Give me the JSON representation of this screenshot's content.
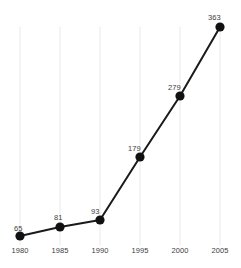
{
  "chart_data": {
    "type": "line",
    "title": "",
    "subtitle": "",
    "xlabel": "",
    "ylabel": "",
    "categories": [
      "1980",
      "1985",
      "1990",
      "1995",
      "2000",
      "2005"
    ],
    "values": [
      65,
      81,
      93,
      179,
      279,
      363
    ],
    "point_labels": [
      "65",
      "81",
      "93",
      "179",
      "279",
      "363"
    ],
    "xlim": [
      1980,
      2005
    ],
    "ylim": [
      65,
      363
    ],
    "grid": "vertical-only",
    "legend": "none",
    "colors": {
      "line": "#1a1a1a",
      "marker": "#111111",
      "gridline": "#e9e9e9",
      "text": "#3d3d3d",
      "background": "#ffffff"
    }
  },
  "geometry": {
    "points": [
      {
        "x": 20,
        "y": 236,
        "lx": 14,
        "ly": 225
      },
      {
        "x": 60,
        "y": 227,
        "lx": 54,
        "ly": 214
      },
      {
        "x": 100,
        "y": 220,
        "lx": 91,
        "ly": 208
      },
      {
        "x": 140,
        "y": 157,
        "lx": 128,
        "ly": 145
      },
      {
        "x": 180,
        "y": 96,
        "lx": 168,
        "ly": 84
      },
      {
        "x": 220,
        "y": 27,
        "lx": 208,
        "ly": 14
      }
    ],
    "gridline_top": 27,
    "gridline_bottom": 245,
    "tick_y": 247
  }
}
